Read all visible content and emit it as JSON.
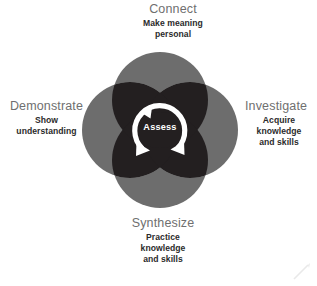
{
  "diagram": {
    "type": "four-circle-venn",
    "center_label": "Assess",
    "colors": {
      "circle": "#6d6d6d",
      "overlap": "#231f20",
      "background": "#ffffff",
      "title_text": "#6f6f6f",
      "sub_text": "#2b2b2b",
      "center_text": "#ffffff"
    },
    "geometry": {
      "center_x": 160,
      "center_y": 130,
      "circle_radius": 48,
      "circle_offset": 30,
      "ring_outer_radius": 25,
      "ring_inner_radius": 18
    },
    "nodes": [
      {
        "id": "connect",
        "title": "Connect",
        "sub_lines": [
          "Make meaning",
          "personal"
        ],
        "position": "top"
      },
      {
        "id": "investigate",
        "title": "Investigate",
        "sub_lines": [
          "Acquire",
          "knowledge",
          "and skills"
        ],
        "position": "right"
      },
      {
        "id": "synthesize",
        "title": "Synthesize",
        "sub_lines": [
          "Practice",
          "knowledge",
          "and skills"
        ],
        "position": "bottom"
      },
      {
        "id": "demonstrate",
        "title": "Demonstrate",
        "sub_lines": [
          "Show",
          "understanding"
        ],
        "position": "left"
      }
    ],
    "center": {
      "label": "Assess",
      "icon": "cycle-arrows-icon"
    }
  }
}
